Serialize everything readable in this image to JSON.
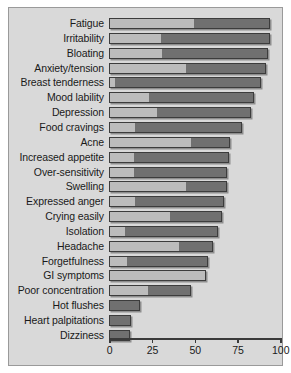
{
  "chart_data": {
    "type": "bar",
    "orientation": "horizontal",
    "stacked": true,
    "title": "",
    "xlabel": "",
    "ylabel": "",
    "xlim": [
      0,
      100
    ],
    "grid": false,
    "legend": null,
    "xticks": [
      "0",
      "25",
      "50",
      "75",
      "100"
    ],
    "xtick_values": [
      0,
      25,
      50,
      75,
      100
    ],
    "categories": [
      "Fatigue",
      "Irritability",
      "Bloating",
      "Anxiety/tension",
      "Breast tenderness",
      "Mood lability",
      "Depression",
      "Food cravings",
      "Acne",
      "Increased appetite",
      "Over-sensitivity",
      "Swelling",
      "Expressed anger",
      "Crying easily",
      "Isolation",
      "Headache",
      "Forgetfulness",
      "GI symptoms",
      "Poor concentration",
      "Hot flushes",
      "Heart palpitations",
      "Dizziness"
    ],
    "series": [
      {
        "name": "mild",
        "values": [
          50,
          30,
          31,
          45,
          3,
          23,
          28,
          15,
          48,
          14,
          14,
          45,
          15,
          36,
          9,
          41,
          10,
          57,
          23,
          0,
          0,
          0
        ]
      },
      {
        "name": "moderate-severe",
        "values": [
          44,
          64,
          62,
          47,
          86,
          62,
          55,
          63,
          23,
          56,
          55,
          24,
          52,
          30,
          55,
          20,
          48,
          0,
          25,
          18,
          13,
          12
        ]
      }
    ],
    "totals": [
      94,
      94,
      93,
      92,
      89,
      85,
      83,
      78,
      71,
      70,
      69,
      69,
      67,
      66,
      64,
      61,
      58,
      57,
      48,
      18,
      13,
      12
    ]
  },
  "colors": {
    "panel_background": "#d9d9d9",
    "panel_border": "#9a9a9a",
    "segment_light": "#bcbcbc",
    "segment_dark": "#707070",
    "bar_outline": "#3c3c3c",
    "axis": "#3a3a3a",
    "text": "#1a1a1a"
  }
}
